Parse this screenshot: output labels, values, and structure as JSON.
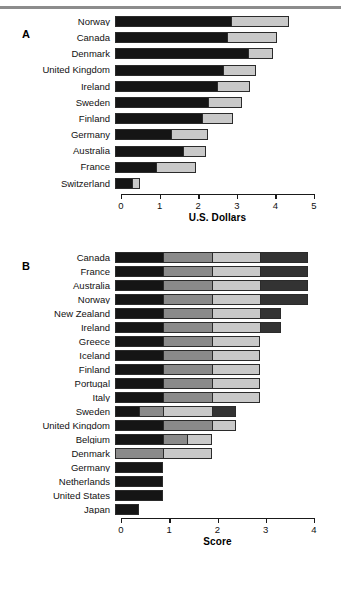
{
  "figure": {
    "panel_a_letter": "A",
    "panel_b_letter": "B"
  },
  "colors": {
    "black": "#151515",
    "light_gray": "#c9c9c9",
    "medium_gray": "#8a8a8a",
    "dark_charcoal": "#333333",
    "outline": "#2b2b2b",
    "top_rule": "#8c8c8c",
    "axis": "#1a1a1a"
  },
  "chart_data": [
    {
      "type": "bar",
      "panel": "A",
      "orientation": "horizontal",
      "stacked": true,
      "title": "",
      "xlabel": "U.S. Dollars",
      "ylabel": "",
      "xlim": [
        0,
        5
      ],
      "xticks": [
        0,
        1,
        2,
        3,
        4,
        5
      ],
      "xticklabels": [
        "0",
        "1",
        "2",
        "3",
        "4",
        "5"
      ],
      "grid": false,
      "legend": "none",
      "categories": [
        "Norway",
        "Canada",
        "Denmark",
        "United Kingdom",
        "Ireland",
        "Sweden",
        "Finland",
        "Germany",
        "Australia",
        "France",
        "Switzerland"
      ],
      "series": [
        {
          "name": "segment-1",
          "color": "#151515",
          "values": [
            3.0,
            2.9,
            3.45,
            2.8,
            2.65,
            2.4,
            2.25,
            1.45,
            1.75,
            1.05,
            0.45
          ]
        },
        {
          "name": "segment-2",
          "color": "#c9c9c9",
          "values": [
            1.5,
            1.3,
            0.65,
            0.85,
            0.85,
            0.9,
            0.8,
            0.95,
            0.6,
            1.05,
            0.2
          ]
        }
      ],
      "totals": [
        4.5,
        4.2,
        4.1,
        3.65,
        3.5,
        3.3,
        3.05,
        2.4,
        2.35,
        2.1,
        0.65
      ]
    },
    {
      "type": "bar",
      "panel": "B",
      "orientation": "horizontal",
      "stacked": true,
      "title": "",
      "xlabel": "Score",
      "ylabel": "",
      "xlim": [
        0,
        4
      ],
      "xticks": [
        0,
        1,
        2,
        3,
        4
      ],
      "xticklabels": [
        "0",
        "1",
        "2",
        "3",
        "4"
      ],
      "grid": false,
      "legend": "none",
      "categories": [
        "Canada",
        "France",
        "Australia",
        "Norway",
        "New Zealand",
        "Ireland",
        "Greece",
        "Iceland",
        "Finland",
        "Portugal",
        "Italy",
        "Sweden",
        "United Kingdom",
        "Belgium",
        "Denmark",
        "Germany",
        "Netherlands",
        "United States",
        "Japan"
      ],
      "stacks": [
        [
          {
            "c": "#151515",
            "v": 1.0
          },
          {
            "c": "#8a8a8a",
            "v": 1.0
          },
          {
            "c": "#c9c9c9",
            "v": 1.0
          },
          {
            "c": "#333333",
            "v": 1.0
          }
        ],
        [
          {
            "c": "#151515",
            "v": 1.0
          },
          {
            "c": "#8a8a8a",
            "v": 1.0
          },
          {
            "c": "#c9c9c9",
            "v": 1.0
          },
          {
            "c": "#333333",
            "v": 1.0
          }
        ],
        [
          {
            "c": "#151515",
            "v": 1.0
          },
          {
            "c": "#8a8a8a",
            "v": 1.0
          },
          {
            "c": "#c9c9c9",
            "v": 1.0
          },
          {
            "c": "#333333",
            "v": 1.0
          }
        ],
        [
          {
            "c": "#151515",
            "v": 1.0
          },
          {
            "c": "#8a8a8a",
            "v": 1.0
          },
          {
            "c": "#c9c9c9",
            "v": 1.0
          },
          {
            "c": "#333333",
            "v": 1.0
          }
        ],
        [
          {
            "c": "#151515",
            "v": 1.0
          },
          {
            "c": "#8a8a8a",
            "v": 1.0
          },
          {
            "c": "#c9c9c9",
            "v": 1.0
          },
          {
            "c": "#333333",
            "v": 0.45
          }
        ],
        [
          {
            "c": "#151515",
            "v": 1.0
          },
          {
            "c": "#8a8a8a",
            "v": 1.0
          },
          {
            "c": "#c9c9c9",
            "v": 1.0
          },
          {
            "c": "#333333",
            "v": 0.45
          }
        ],
        [
          {
            "c": "#151515",
            "v": 1.0
          },
          {
            "c": "#8a8a8a",
            "v": 1.0
          },
          {
            "c": "#c9c9c9",
            "v": 1.0
          }
        ],
        [
          {
            "c": "#151515",
            "v": 1.0
          },
          {
            "c": "#8a8a8a",
            "v": 1.0
          },
          {
            "c": "#c9c9c9",
            "v": 1.0
          }
        ],
        [
          {
            "c": "#151515",
            "v": 1.0
          },
          {
            "c": "#8a8a8a",
            "v": 1.0
          },
          {
            "c": "#c9c9c9",
            "v": 1.0
          }
        ],
        [
          {
            "c": "#151515",
            "v": 1.0
          },
          {
            "c": "#8a8a8a",
            "v": 1.0
          },
          {
            "c": "#c9c9c9",
            "v": 1.0
          }
        ],
        [
          {
            "c": "#151515",
            "v": 1.0
          },
          {
            "c": "#8a8a8a",
            "v": 1.0
          },
          {
            "c": "#c9c9c9",
            "v": 1.0
          }
        ],
        [
          {
            "c": "#151515",
            "v": 0.5
          },
          {
            "c": "#8a8a8a",
            "v": 0.5
          },
          {
            "c": "#c9c9c9",
            "v": 1.0
          },
          {
            "c": "#333333",
            "v": 0.5
          }
        ],
        [
          {
            "c": "#151515",
            "v": 1.0
          },
          {
            "c": "#8a8a8a",
            "v": 1.0
          },
          {
            "c": "#c9c9c9",
            "v": 0.5
          }
        ],
        [
          {
            "c": "#151515",
            "v": 1.0
          },
          {
            "c": "#8a8a8a",
            "v": 0.5
          },
          {
            "c": "#c9c9c9",
            "v": 0.5
          }
        ],
        [
          {
            "c": "#8a8a8a",
            "v": 1.0
          },
          {
            "c": "#c9c9c9",
            "v": 1.0
          }
        ],
        [
          {
            "c": "#151515",
            "v": 1.0
          }
        ],
        [
          {
            "c": "#151515",
            "v": 1.0
          }
        ],
        [
          {
            "c": "#151515",
            "v": 1.0
          }
        ],
        [
          {
            "c": "#151515",
            "v": 0.5
          }
        ]
      ],
      "totals": [
        4.0,
        4.0,
        4.0,
        4.0,
        3.45,
        3.45,
        3.0,
        3.0,
        3.0,
        3.0,
        3.0,
        2.5,
        2.5,
        2.0,
        2.0,
        1.0,
        1.0,
        1.0,
        0.5
      ]
    }
  ]
}
